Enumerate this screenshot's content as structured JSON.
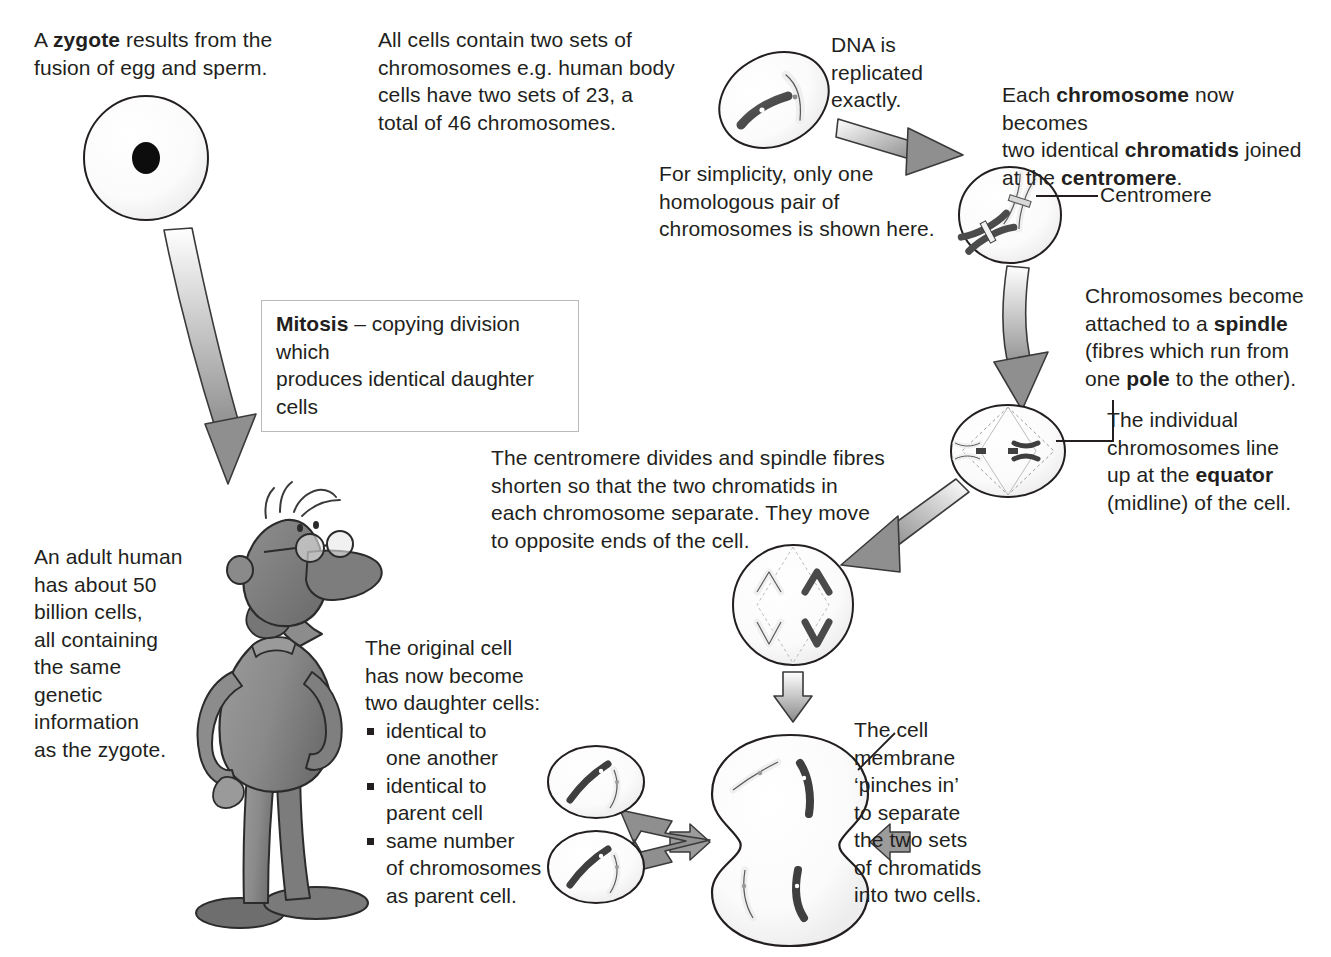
{
  "diagram": {
    "type": "biology-process-diagram"
  },
  "labels": {
    "zygote": "A <b>zygote</b> results from the\nfusion of egg and sperm.",
    "all_cells": "All cells contain two sets of\nchromosomes e.g. human body\ncells have two sets of 23, a\ntotal of 46 chromosomes.",
    "simplicity": "For simplicity, only one\nhomologous pair of\nchromosomes is shown here.",
    "dna_replicated": "DNA is\nreplicated\nexactly.",
    "chromatids": "Each <b>chromosome</b> now becomes\ntwo identical <b>chromatids</b> joined\nat the <b>centromere</b>.",
    "centromere": "Centromere",
    "spindle": "Chromosomes become\nattached to a <b>spindle</b>\n(fibres which run from\none <b>pole</b> to the other).",
    "equator": "The individual\nchromosomes line\nup at the <b>equator</b>\n(midline) of the cell.",
    "mitosis_box": "<b>Mitosis</b> – copying division which\nproduces identical daughter cells",
    "centromere_divides": "The centromere divides and spindle fibres\nshorten so that the two chromatids in\neach chromosome separate. They move\nto opposite ends of the cell.",
    "adult_human": "An adult human\nhas about 50\nbillion cells,\nall containing\nthe same\ngenetic\ninformation\nas the zygote.",
    "original_cell_intro": "The original cell\n has now become\ntwo daughter cells:",
    "original_cell_bullets": [
      "identical to\none another",
      "identical to\nparent cell",
      "same number\nof chromosomes\nas parent cell."
    ],
    "cell_membrane": "The cell\nmembrane\n‘pinches in’\nto separate\nthe two sets\nof chromatids\ninto two cells."
  },
  "colors": {
    "text": "#231f20",
    "outline": "#231f20",
    "arrow_light": "#ffffff",
    "arrow_dark": "#8a8a8a",
    "chromosome_dark": "#4a4a4a",
    "chromosome_light": "#f2f2f2",
    "cell_fill": "#fbfbfb",
    "box_border": "#b9babc",
    "character_gray": "#8d8d8d"
  },
  "cells": [
    {
      "name": "zygote-cell",
      "stage": "zygote",
      "shape": "circle",
      "contents": "single dark nucleus"
    },
    {
      "name": "interphase-cell",
      "stage": "after DNA replication",
      "shape": "oval",
      "contents": "one dark chromosome and one light chromosome"
    },
    {
      "name": "chromatid-cell",
      "stage": "chromatids joined at centromere",
      "shape": "oval",
      "contents": "two X-shaped chromosomes, each two chromatids"
    },
    {
      "name": "metaphase-cell",
      "stage": "chromosomes at equator",
      "shape": "oval",
      "contents": "spindle fibres with two chromosomes on midline"
    },
    {
      "name": "anaphase-cell",
      "stage": "chromatids move to poles",
      "shape": "circle",
      "contents": "four V-shaped chromatids moving apart"
    },
    {
      "name": "telophase-cell",
      "stage": "membrane pinches in",
      "shape": "figure-eight",
      "contents": "two sets of chromatids separating into two cells"
    },
    {
      "name": "daughter-cell-top",
      "stage": "daughter cell",
      "shape": "oval",
      "contents": "one dark and one light chromosome"
    },
    {
      "name": "daughter-cell-bottom",
      "stage": "daughter cell",
      "shape": "oval",
      "contents": "one dark and one light chromosome"
    }
  ],
  "character": {
    "name": "cartoon-man",
    "description": "grey cartoon man with glasses, hand on chin, hand on hip, large shoes"
  }
}
